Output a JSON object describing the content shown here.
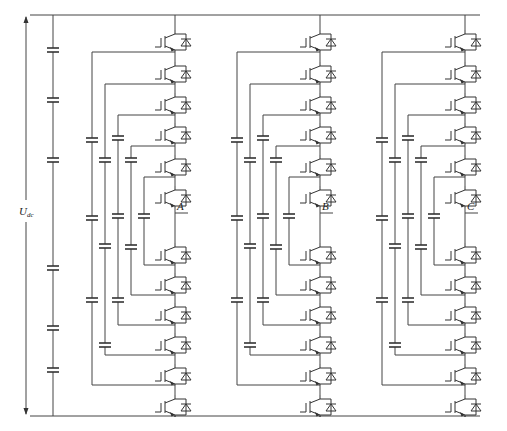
{
  "diagram": {
    "dc_voltage_label": "U",
    "dc_voltage_subscript": "dc",
    "colors": {
      "wire": "#444444",
      "background": "#ffffff"
    },
    "bus": {
      "top_y": 15,
      "bottom_y": 416,
      "x_start": 38,
      "x_end": 480
    },
    "dc_link": {
      "x": 53,
      "capacitor_count": 6,
      "capacitor_y": [
        50,
        100,
        160,
        268,
        328,
        370
      ]
    },
    "arrow_x": 26,
    "phases": [
      {
        "label": "A",
        "switch_x": 175,
        "output_y": 213
      },
      {
        "label": "B",
        "switch_x": 320,
        "output_y": 213
      },
      {
        "label": "C",
        "switch_x": 465,
        "output_y": 213
      }
    ],
    "switches_per_phase": 12,
    "switch_y": [
      30,
      62,
      93,
      123,
      155,
      186,
      243,
      273,
      303,
      333,
      364,
      395
    ]
  }
}
